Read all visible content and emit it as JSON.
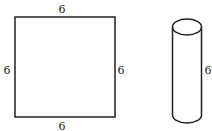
{
  "square": {
    "top_label": "6",
    "bottom_label": "6",
    "left_label": "6",
    "right_label": "6"
  },
  "cylinder": {
    "height_label": "6"
  },
  "colors": {
    "stroke": "#222222",
    "background": "#ffffff"
  }
}
